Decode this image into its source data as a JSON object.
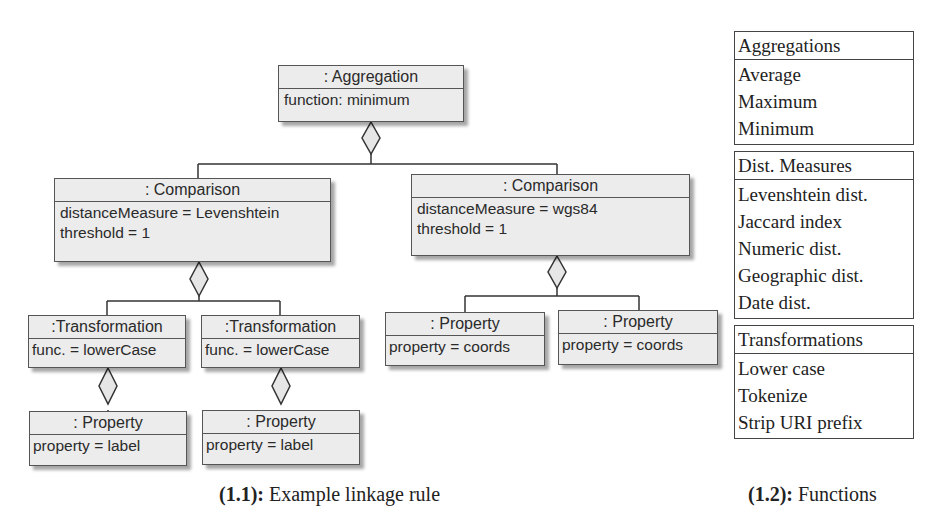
{
  "diagram": {
    "aggregation": {
      "title": ": Aggregation",
      "attrs": [
        "function: minimum"
      ]
    },
    "comparison_left": {
      "title": ": Comparison",
      "attrs": [
        "distanceMeasure = Levenshtein",
        "threshold = 1"
      ]
    },
    "comparison_right": {
      "title": ": Comparison",
      "attrs": [
        "distanceMeasure = wgs84",
        "threshold = 1"
      ]
    },
    "transformation_1": {
      "title": ":Transformation",
      "attrs": [
        "func. = lowerCase"
      ]
    },
    "transformation_2": {
      "title": ":Transformation",
      "attrs": [
        "func. = lowerCase"
      ]
    },
    "property_1": {
      "title": ": Property",
      "attrs": [
        "property = label"
      ]
    },
    "property_2": {
      "title": ": Property",
      "attrs": [
        "property = label"
      ]
    },
    "property_3": {
      "title": ": Property",
      "attrs": [
        "property = coords"
      ]
    },
    "property_4": {
      "title": ": Property",
      "attrs": [
        "property = coords"
      ]
    },
    "caption": {
      "label": "(1.1):",
      "text": " Example linkage rule"
    }
  },
  "functions": {
    "groups": [
      {
        "header": "Aggregations",
        "items": [
          "Average",
          "Maximum",
          "Minimum"
        ]
      },
      {
        "header": "Dist. Measures",
        "items": [
          "Levenshtein dist.",
          "Jaccard index",
          "Numeric dist.",
          "Geographic dist.",
          "Date dist."
        ]
      },
      {
        "header": "Transformations",
        "items": [
          "Lower case",
          "Tokenize",
          "Strip URI prefix"
        ]
      }
    ],
    "caption": {
      "label": "(1.2):",
      "text": " Functions"
    }
  }
}
